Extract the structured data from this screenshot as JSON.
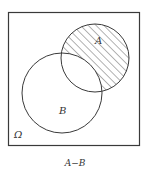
{
  "diagram": {
    "type": "venn",
    "universe_label": "Ω",
    "set_a_label": "A",
    "set_b_label": "B",
    "caption": "A−B",
    "shaded_region": "A minus B",
    "colors": {
      "stroke": "#3a3a3a",
      "hatch": "#555555",
      "background": "#ffffff"
    }
  }
}
